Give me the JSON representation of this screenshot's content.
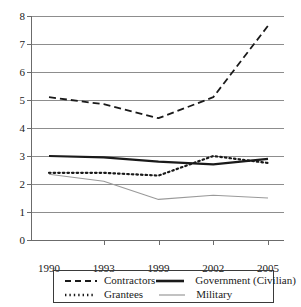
{
  "clipped_caption": "",
  "chart_data": {
    "type": "line",
    "title": "",
    "xlabel": "",
    "ylabel": "",
    "x": [
      1990,
      1993,
      1999,
      2002,
      2005
    ],
    "categories": [
      "1990",
      "1993",
      "1999",
      "2002",
      "2005"
    ],
    "xtick_labels": [
      "1990",
      "1993",
      "1999",
      "2002",
      "2005"
    ],
    "ytick_labels": [
      "0",
      "1",
      "2",
      "3",
      "4",
      "5",
      "6",
      "7",
      "8"
    ],
    "ylim": [
      0,
      8
    ],
    "ytick_step": 1,
    "grid": "horizontal",
    "legend_position": "bottom",
    "series": [
      {
        "name": "Contractors",
        "style": "dashed",
        "color": "#1a1a1a",
        "width": 1.8,
        "values": [
          5.1,
          4.85,
          4.35,
          5.1,
          7.65
        ]
      },
      {
        "name": "Government (Civilian)",
        "style": "solid-bold",
        "color": "#1a1a1a",
        "width": 2.2,
        "values": [
          3.0,
          2.95,
          2.8,
          2.7,
          2.9
        ]
      },
      {
        "name": "Grantees",
        "style": "dotted",
        "color": "#1a1a1a",
        "width": 2.2,
        "values": [
          2.4,
          2.4,
          2.3,
          3.0,
          2.75
        ]
      },
      {
        "name": "Military",
        "style": "solid-thin",
        "color": "#9a9a9a",
        "width": 1.1,
        "values": [
          2.35,
          2.1,
          1.45,
          1.6,
          1.5
        ]
      }
    ]
  },
  "legend": {
    "entries": [
      {
        "label": "Contractors",
        "swatch": "dashed-line-swatch"
      },
      {
        "label": "Government (Civilian)",
        "swatch": "solid-bold-line-swatch"
      },
      {
        "label": "Grantees",
        "swatch": "dotted-line-swatch"
      },
      {
        "label": "Military",
        "swatch": "solid-thin-line-swatch"
      }
    ]
  }
}
